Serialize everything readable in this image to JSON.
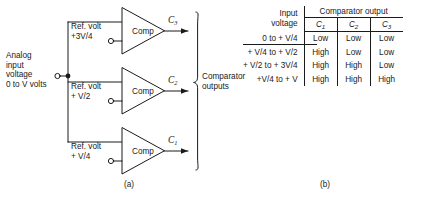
{
  "figure": {
    "caption_a": "(a)",
    "caption_b": "(b)"
  },
  "circuit": {
    "analog_input_label": "Analog\ninput\nvoltage\n0 to V volts",
    "analog_input_lines": [
      "Analog",
      "input",
      "voltage",
      "0 to V volts"
    ],
    "bus_brace_label_lines": [
      "Comparator",
      "outputs"
    ],
    "comparators": [
      {
        "id": "comp-3",
        "body_label": "Comp",
        "ref_label_line1": "Ref. volt",
        "ref_label_line2": "+3V/4",
        "output_label": "C",
        "output_sub": "3"
      },
      {
        "id": "comp-2",
        "body_label": "Comp",
        "ref_label_line1": "Ref. volt",
        "ref_label_line2": "+ V/2",
        "output_label": "C",
        "output_sub": "2"
      },
      {
        "id": "comp-1",
        "body_label": "Comp",
        "ref_label_line1": "Ref. volt",
        "ref_label_line2": "+ V/4",
        "output_label": "C",
        "output_sub": "1"
      }
    ]
  },
  "table": {
    "header_input_line1": "Input",
    "header_input_line2": "voltage",
    "header_span": "Comparator output",
    "columns": [
      {
        "label": "C",
        "sub": "1"
      },
      {
        "label": "C",
        "sub": "2"
      },
      {
        "label": "C",
        "sub": "3"
      }
    ],
    "rows": [
      {
        "input": "0 to + V/4",
        "c1": "Low",
        "c2": "Low",
        "c3": "Low"
      },
      {
        "input": "+ V/4 to + V/2",
        "c1": "High",
        "c2": "Low",
        "c3": "Low"
      },
      {
        "input": "+ V/2 to + 3V/4",
        "c1": "High",
        "c2": "High",
        "c3": "Low"
      },
      {
        "input": "+V/4 to + V",
        "c1": "High",
        "c2": "High",
        "c3": "High"
      }
    ]
  },
  "colors": {
    "ink": "#1a1a1a",
    "background": "#ffffff"
  }
}
